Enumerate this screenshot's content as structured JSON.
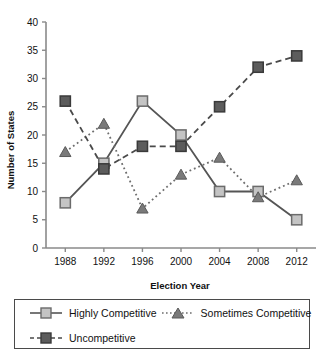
{
  "chart_data": {
    "type": "line",
    "title": "",
    "xlabel": "Election Year",
    "ylabel": "Number of States",
    "categories": [
      "1988",
      "1992",
      "1996",
      "2000",
      "2004",
      "2008",
      "2012"
    ],
    "x": [
      1988,
      1992,
      1996,
      2000,
      2004,
      2008,
      2012
    ],
    "xlim": [
      1986,
      2014
    ],
    "ylim": [
      0,
      40
    ],
    "ytick_labels": [
      "0",
      "5",
      "10",
      "15",
      "20",
      "25",
      "30",
      "35",
      "40"
    ],
    "yticks": [
      0,
      5,
      10,
      15,
      20,
      25,
      30,
      35,
      40
    ],
    "grid": false,
    "legend_position": "bottom",
    "series": [
      {
        "name": "Highly Competitive",
        "values": [
          8,
          15,
          26,
          20,
          10,
          10,
          5
        ],
        "marker": "square",
        "marker_color": "#c4c4c4",
        "marker_edge_color": "#6b6b6b",
        "line_style": "solid",
        "line_color": "#555555"
      },
      {
        "name": "Sometimes Competitive",
        "values": [
          17,
          22,
          7,
          13,
          16,
          9,
          12
        ],
        "marker": "triangle",
        "marker_color": "#7a7a7a",
        "marker_edge_color": "#5a5a5a",
        "line_style": "dotted",
        "line_color": "#6e6e6e"
      },
      {
        "name": "Uncompetitive",
        "values": [
          26,
          14,
          18,
          18,
          25,
          32,
          34
        ],
        "marker": "square",
        "marker_color": "#5c5c5c",
        "marker_edge_color": "#3a3a3a",
        "line_style": "dashed",
        "line_color": "#4a4a4a"
      }
    ]
  },
  "legend": {
    "entries": [
      {
        "label": "Highly Competitive"
      },
      {
        "label": "Sometimes Competitive"
      },
      {
        "label": "Uncompetitive"
      }
    ]
  }
}
